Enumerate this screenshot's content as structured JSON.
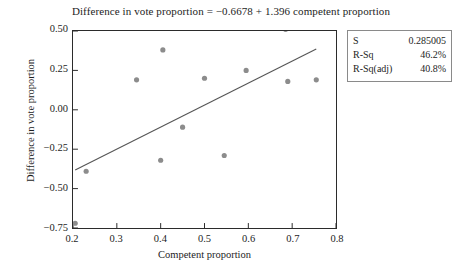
{
  "chart_data": {
    "type": "scatter",
    "title": "Difference in vote proportion = −0.6678 + 1.396 competent proportion",
    "xlabel": "Competent proportion",
    "ylabel": "Difference in vote proportion",
    "xlim": [
      0.2,
      0.8
    ],
    "ylim": [
      -0.75,
      0.5
    ],
    "xticks": [
      "0.2",
      "0.3",
      "0.4",
      "0.5",
      "0.6",
      "0.7",
      "0.8"
    ],
    "xtick_values": [
      0.2,
      0.3,
      0.4,
      0.5,
      0.6,
      0.7,
      0.8
    ],
    "yticks": [
      "0.50",
      "0.25",
      "0.00",
      "−0.25",
      "−0.50",
      "−0.75"
    ],
    "ytick_values": [
      0.5,
      0.25,
      0.0,
      -0.25,
      -0.5,
      -0.75
    ],
    "grid": false,
    "legend_position": "none",
    "marker_color": "#8c8c8c",
    "line_color": "#555555",
    "points": [
      {
        "x": 0.205,
        "y": -0.72
      },
      {
        "x": 0.23,
        "y": -0.39
      },
      {
        "x": 0.345,
        "y": 0.19
      },
      {
        "x": 0.4,
        "y": -0.32
      },
      {
        "x": 0.405,
        "y": 0.38
      },
      {
        "x": 0.45,
        "y": -0.11
      },
      {
        "x": 0.5,
        "y": 0.2
      },
      {
        "x": 0.545,
        "y": -0.29
      },
      {
        "x": 0.595,
        "y": 0.25
      },
      {
        "x": 0.685,
        "y": 0.51
      },
      {
        "x": 0.69,
        "y": 0.18
      },
      {
        "x": 0.755,
        "y": 0.19
      }
    ],
    "fit_line": {
      "intercept": -0.6678,
      "slope": 1.396,
      "x_start": 0.205,
      "x_end": 0.755
    },
    "annotations": {
      "stats": [
        {
          "label": "S",
          "value": "0.285005"
        },
        {
          "label": "R-Sq",
          "value": "46.2%"
        },
        {
          "label": "R-Sq(adj)",
          "value": "40.8%"
        }
      ]
    }
  }
}
